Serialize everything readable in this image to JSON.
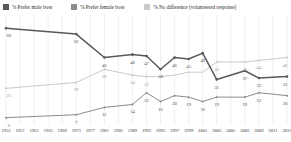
{
  "legend": {
    "items": [
      {
        "label": "% Prefer male boss",
        "color": "#595959",
        "icon": "legend-swatch-male-boss"
      },
      {
        "label": "% Prefer female boss",
        "color": "#8c8c8c",
        "icon": "legend-swatch-female-boss"
      },
      {
        "label": "% No difference (volunteered response)",
        "color": "#c9c9c9",
        "icon": "legend-swatch-no-difference"
      }
    ]
  },
  "chart_data": {
    "type": "line",
    "title": "",
    "xlabel": "",
    "ylabel": "",
    "ylim": [
      0,
      75
    ],
    "grid": "vertical",
    "legend_position": "top",
    "x": [
      1953,
      1957,
      1961,
      1965,
      1969,
      1973,
      1977,
      1981,
      1985,
      1989,
      1993,
      1995,
      1997,
      1999,
      2001,
      2003,
      2005,
      2006,
      2009,
      2011,
      2013
    ],
    "xticks": [
      "1953",
      "1957",
      "1961",
      "1965",
      "1969",
      "1973",
      "1977",
      "1981",
      "1985",
      "1989",
      "1993",
      "1995",
      "1997",
      "1999",
      "2001",
      "2003",
      "2005",
      "2006",
      "2009",
      "2011",
      "2013"
    ],
    "series": [
      {
        "name": "% Prefer male boss",
        "color": "#595959",
        "values": [
          66,
          null,
          null,
          null,
          null,
          62,
          null,
          46,
          null,
          48,
          47,
          38,
          46,
          45,
          49,
          31,
          null,
          37,
          32,
          null,
          33
        ],
        "labels": [
          "66",
          "",
          "",
          "",
          "",
          "62",
          "",
          "46",
          "",
          "48",
          "47",
          "38",
          "46",
          "45",
          "49",
          "31",
          "",
          "37",
          "32",
          "",
          "33"
        ]
      },
      {
        "name": "% Prefer female boss",
        "color": "#c9c9c9",
        "values": [
          25,
          null,
          null,
          null,
          null,
          29,
          null,
          38,
          null,
          34,
          33,
          33,
          34,
          36,
          36,
          43,
          null,
          43,
          44,
          null,
          46
        ],
        "labels": [
          "25",
          "",
          "",
          "",
          "",
          "29",
          "",
          "38",
          "",
          "34",
          "33",
          "",
          "",
          "",
          "",
          "43",
          "",
          "43",
          "44",
          "",
          "46"
        ]
      },
      {
        "name": "% No difference (volunteered response)",
        "color": "#8c8c8c",
        "values": [
          5,
          null,
          null,
          null,
          null,
          7,
          null,
          12,
          null,
          14,
          22,
          16,
          20,
          19,
          16,
          19,
          null,
          19,
          22,
          null,
          20
        ],
        "labels": [
          "5",
          "",
          "",
          "",
          "",
          "7",
          "",
          "12",
          "",
          "14",
          "22",
          "16",
          "20",
          "19",
          "16",
          "19",
          "",
          "19",
          "22",
          "",
          "20"
        ]
      }
    ]
  }
}
